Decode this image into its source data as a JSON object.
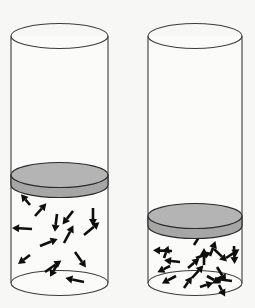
{
  "figure": {
    "background_color": "#f7f7f5",
    "outline_color": "#3c3c3c",
    "piston_top_color": "#b4b4b4",
    "piston_side_color": "#a6a6a6",
    "arrow_color": "#0d0d0d",
    "width": 255,
    "height": 308
  },
  "chart_data": {
    "type": "diagram",
    "cylinders": [
      {
        "id": "left",
        "label": "Left cylinder - larger gas volume",
        "left_x": 11,
        "right_x": 108,
        "top_y": 36,
        "bottom_y": 283,
        "rx": 48.5,
        "ry": 12.5,
        "piston_top_y": 175,
        "piston_thickness": 10,
        "gas_column_height": 108,
        "molecule_count": 14
      },
      {
        "id": "right",
        "label": "Right cylinder - smaller gas volume",
        "left_x": 148,
        "right_x": 242,
        "top_y": 36,
        "bottom_y": 283,
        "rx": 47,
        "ry": 12.5,
        "piston_top_y": 216,
        "piston_thickness": 10,
        "gas_column_height": 67,
        "molecule_count": 20
      }
    ],
    "arrows_left": [
      {
        "x": 35,
        "y": 216,
        "angle": -48,
        "len": 17
      },
      {
        "x": 30,
        "y": 205,
        "angle": -130,
        "len": 14
      },
      {
        "x": 32,
        "y": 229,
        "angle": 183,
        "len": 20
      },
      {
        "x": 57,
        "y": 214,
        "angle": 97,
        "len": 18
      },
      {
        "x": 73,
        "y": 211,
        "angle": 128,
        "len": 17
      },
      {
        "x": 93,
        "y": 208,
        "angle": 90,
        "len": 18
      },
      {
        "x": 40,
        "y": 246,
        "angle": -22,
        "len": 19
      },
      {
        "x": 30,
        "y": 255,
        "angle": 143,
        "len": 15
      },
      {
        "x": 64,
        "y": 243,
        "angle": -62,
        "len": 20
      },
      {
        "x": 84,
        "y": 235,
        "angle": -40,
        "len": 20
      },
      {
        "x": 75,
        "y": 252,
        "angle": 55,
        "len": 19
      },
      {
        "x": 58,
        "y": 263,
        "angle": 120,
        "len": 16
      },
      {
        "x": 45,
        "y": 272,
        "angle": -35,
        "len": 20
      },
      {
        "x": 84,
        "y": 282,
        "angle": 192,
        "len": 19
      }
    ],
    "arrows_right": [
      {
        "x": 172,
        "y": 251,
        "angle": 182,
        "len": 19
      },
      {
        "x": 194,
        "y": 245,
        "angle": -58,
        "len": 19
      },
      {
        "x": 214,
        "y": 249,
        "angle": 44,
        "len": 18
      },
      {
        "x": 234,
        "y": 246,
        "angle": 88,
        "len": 18
      },
      {
        "x": 180,
        "y": 262,
        "angle": 186,
        "len": 16
      },
      {
        "x": 196,
        "y": 258,
        "angle": -20,
        "len": 16
      },
      {
        "x": 210,
        "y": 256,
        "angle": -70,
        "len": 16
      },
      {
        "x": 226,
        "y": 258,
        "angle": -33,
        "len": 16
      },
      {
        "x": 170,
        "y": 266,
        "angle": 154,
        "len": 14
      },
      {
        "x": 188,
        "y": 268,
        "angle": -40,
        "len": 15
      },
      {
        "x": 204,
        "y": 265,
        "angle": -90,
        "len": 17
      },
      {
        "x": 217,
        "y": 267,
        "angle": 58,
        "len": 17
      },
      {
        "x": 176,
        "y": 276,
        "angle": 152,
        "len": 16
      },
      {
        "x": 192,
        "y": 278,
        "angle": -48,
        "len": 17
      },
      {
        "x": 207,
        "y": 276,
        "angle": 30,
        "len": 15
      },
      {
        "x": 232,
        "y": 281,
        "angle": 188,
        "len": 18
      },
      {
        "x": 184,
        "y": 288,
        "angle": -55,
        "len": 14
      },
      {
        "x": 200,
        "y": 287,
        "angle": -18,
        "len": 14
      },
      {
        "x": 219,
        "y": 285,
        "angle": 62,
        "len": 13
      },
      {
        "x": 164,
        "y": 258,
        "angle": -70,
        "len": 13
      }
    ]
  }
}
